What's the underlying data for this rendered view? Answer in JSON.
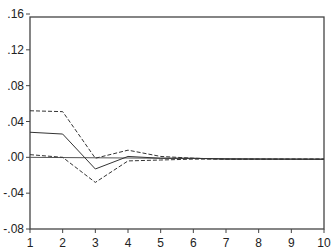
{
  "chart_data": {
    "type": "line",
    "title": "",
    "xlabel": "",
    "ylabel": "",
    "x": [
      1,
      2,
      3,
      4,
      5,
      6,
      7,
      8,
      9,
      10
    ],
    "xlim": [
      1,
      10
    ],
    "ylim": [
      -0.08,
      0.16
    ],
    "yticks": [
      ".16",
      ".12",
      ".08",
      ".04",
      ".00",
      "-.04",
      "-.08"
    ],
    "ytick_values": [
      0.16,
      0.12,
      0.08,
      0.04,
      0.0,
      -0.04,
      -0.08
    ],
    "xticks": [
      "1",
      "2",
      "3",
      "4",
      "5",
      "6",
      "7",
      "8",
      "9",
      "10"
    ],
    "grid": false,
    "legend": null,
    "zero_line": true,
    "series": [
      {
        "name": "response",
        "style": "solid",
        "values": [
          0.028,
          0.026,
          -0.013,
          0.001,
          -0.001,
          -0.001,
          -0.002,
          -0.002,
          -0.002,
          -0.002
        ]
      },
      {
        "name": "upper band",
        "style": "dashed",
        "values": [
          0.052,
          0.051,
          -0.001,
          0.008,
          0.001,
          -0.001,
          -0.002,
          -0.002,
          -0.002,
          -0.002
        ]
      },
      {
        "name": "lower band",
        "style": "dashed",
        "values": [
          0.003,
          0.0,
          -0.028,
          -0.004,
          -0.003,
          -0.002,
          -0.002,
          -0.002,
          -0.002,
          -0.002
        ]
      }
    ]
  }
}
